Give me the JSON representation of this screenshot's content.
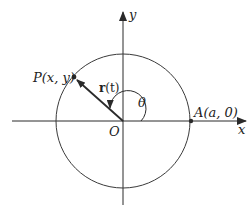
{
  "diagram": {
    "type": "circle-position-vector",
    "axes": {
      "x_label": "x",
      "y_label": "y",
      "origin_label": "O"
    },
    "circle": {
      "center": [
        123,
        121
      ],
      "radius": 68
    },
    "points": {
      "P": {
        "label": "P(x, y)",
        "coords": [
          74,
          77
        ]
      },
      "A": {
        "label": "A(a, 0)",
        "coords": [
          191,
          121
        ]
      }
    },
    "vector": {
      "label_main": "r",
      "label_arg": "(t)",
      "from": "O",
      "to": "P"
    },
    "angle": {
      "label": "θ"
    },
    "colors": {
      "stroke": "#2a2a2a",
      "background": "#ffffff"
    }
  }
}
